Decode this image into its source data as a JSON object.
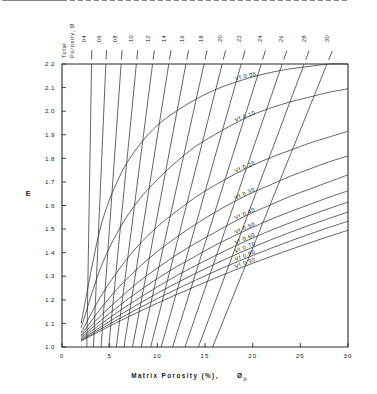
{
  "figure": {
    "title": "",
    "y_axis_label": "E",
    "x_axis_label": "Matrix Porosity  (%),",
    "x_axis_label_sub": "b",
    "x_axis_label_symbol": "Ø",
    "top_axis_label_line1": "Total",
    "top_axis_label_line2": "Porosity,",
    "top_axis_label_symbol": "Ø",
    "marker_label": "VILLEROY 2",
    "marker_value": 1.555
  },
  "chart_data": {
    "type": "line",
    "title": "",
    "xlabel": "Matrix Porosity (%), Øb",
    "ylabel": "E",
    "xlim": [
      0,
      30
    ],
    "ylim": [
      1.0,
      2.2
    ],
    "grid": false,
    "legend_position": "inline-right",
    "x_ticks": [
      "0",
      "5",
      "10",
      "15",
      "20",
      "25",
      "30"
    ],
    "x_tick_values": [
      0,
      5,
      10,
      15,
      20,
      25,
      30
    ],
    "y_ticks": [
      "1.0",
      "1.1",
      "1.2",
      "1.3",
      "1.4",
      "1.5",
      "1.6",
      "1.7",
      "1.8",
      "1.9",
      "2.0",
      "2.1",
      "2.2"
    ],
    "y_tick_values": [
      1.0,
      1.1,
      1.2,
      1.3,
      1.4,
      1.5,
      1.6,
      1.7,
      1.8,
      1.9,
      2.0,
      2.1,
      2.2
    ],
    "annotations": [
      {
        "text": "VILLEROY 2",
        "y": 1.555,
        "style": "dashed-horizontal"
      }
    ],
    "series": [
      {
        "name": "Vf 0.05",
        "label": "Vf  0.05",
        "vf": 0.05,
        "points": [
          [
            2.0,
            1.1
          ],
          [
            4.0,
            1.5
          ],
          [
            6.0,
            1.72
          ],
          [
            8.0,
            1.85
          ],
          [
            10.0,
            1.94
          ],
          [
            12.0,
            2.0
          ],
          [
            14.0,
            2.05
          ],
          [
            16.0,
            2.09
          ],
          [
            18.0,
            2.12
          ],
          [
            20.0,
            2.145
          ],
          [
            22.0,
            2.165
          ],
          [
            24.0,
            2.18
          ],
          [
            26.0,
            2.19
          ],
          [
            28.0,
            2.2
          ],
          [
            30.0,
            2.205
          ]
        ]
      },
      {
        "name": "Vf 0.10",
        "label": "Vf  0.10",
        "vf": 0.1,
        "points": [
          [
            2.0,
            1.08
          ],
          [
            4.0,
            1.33
          ],
          [
            6.0,
            1.5
          ],
          [
            8.0,
            1.62
          ],
          [
            10.0,
            1.71
          ],
          [
            12.0,
            1.785
          ],
          [
            14.0,
            1.85
          ],
          [
            16.0,
            1.9
          ],
          [
            18.0,
            1.945
          ],
          [
            20.0,
            1.985
          ],
          [
            22.0,
            2.015
          ],
          [
            24.0,
            2.04
          ],
          [
            26.0,
            2.06
          ],
          [
            28.0,
            2.08
          ],
          [
            30.0,
            2.095
          ]
        ]
      },
      {
        "name": "Vf 0.20",
        "label": "Vf 0.20",
        "vf": 0.2,
        "points": [
          [
            2.0,
            1.06
          ],
          [
            4.0,
            1.21
          ],
          [
            6.0,
            1.33
          ],
          [
            8.0,
            1.43
          ],
          [
            10.0,
            1.51
          ],
          [
            12.0,
            1.575
          ],
          [
            14.0,
            1.635
          ],
          [
            16.0,
            1.685
          ],
          [
            18.0,
            1.73
          ],
          [
            20.0,
            1.77
          ],
          [
            22.0,
            1.805
          ],
          [
            24.0,
            1.835
          ],
          [
            26.0,
            1.865
          ],
          [
            28.0,
            1.89
          ],
          [
            30.0,
            1.915
          ]
        ]
      },
      {
        "name": "Vf 0.30",
        "label": "Vf  0.30",
        "vf": 0.3,
        "points": [
          [
            2.0,
            1.05
          ],
          [
            4.0,
            1.16
          ],
          [
            6.0,
            1.255
          ],
          [
            8.0,
            1.335
          ],
          [
            10.0,
            1.405
          ],
          [
            12.0,
            1.465
          ],
          [
            14.0,
            1.52
          ],
          [
            16.0,
            1.57
          ],
          [
            18.0,
            1.615
          ],
          [
            20.0,
            1.655
          ],
          [
            22.0,
            1.69
          ],
          [
            24.0,
            1.725
          ],
          [
            26.0,
            1.755
          ],
          [
            28.0,
            1.785
          ],
          [
            30.0,
            1.81
          ]
        ]
      },
      {
        "name": "Vf 0.40",
        "label": "Vf  0.40",
        "vf": 0.4,
        "points": [
          [
            2.0,
            1.045
          ],
          [
            4.0,
            1.13
          ],
          [
            6.0,
            1.205
          ],
          [
            8.0,
            1.275
          ],
          [
            10.0,
            1.335
          ],
          [
            12.0,
            1.39
          ],
          [
            14.0,
            1.44
          ],
          [
            16.0,
            1.485
          ],
          [
            18.0,
            1.53
          ],
          [
            20.0,
            1.57
          ],
          [
            22.0,
            1.605
          ],
          [
            24.0,
            1.64
          ],
          [
            26.0,
            1.67
          ],
          [
            28.0,
            1.7
          ],
          [
            30.0,
            1.73
          ]
        ]
      },
      {
        "name": "Vf 0.50",
        "label": "Vf  0.50",
        "vf": 0.5,
        "points": [
          [
            2.0,
            1.04
          ],
          [
            4.0,
            1.11
          ],
          [
            6.0,
            1.175
          ],
          [
            8.0,
            1.235
          ],
          [
            10.0,
            1.29
          ],
          [
            12.0,
            1.34
          ],
          [
            14.0,
            1.385
          ],
          [
            16.0,
            1.43
          ],
          [
            18.0,
            1.47
          ],
          [
            20.0,
            1.508
          ],
          [
            22.0,
            1.543
          ],
          [
            24.0,
            1.575
          ],
          [
            26.0,
            1.605
          ],
          [
            28.0,
            1.635
          ],
          [
            30.0,
            1.662
          ]
        ]
      },
      {
        "name": "Vf 0.60",
        "label": "Vf  0.60",
        "vf": 0.6,
        "points": [
          [
            2.0,
            1.035
          ],
          [
            4.0,
            1.095
          ],
          [
            6.0,
            1.152
          ],
          [
            8.0,
            1.205
          ],
          [
            10.0,
            1.255
          ],
          [
            12.0,
            1.302
          ],
          [
            14.0,
            1.345
          ],
          [
            16.0,
            1.386
          ],
          [
            18.0,
            1.425
          ],
          [
            20.0,
            1.462
          ],
          [
            22.0,
            1.496
          ],
          [
            24.0,
            1.528
          ],
          [
            26.0,
            1.558
          ],
          [
            28.0,
            1.587
          ],
          [
            30.0,
            1.614
          ]
        ]
      },
      {
        "name": "Vf 0.70",
        "label": "Vf  0.70",
        "vf": 0.7,
        "points": [
          [
            2.0,
            1.03
          ],
          [
            4.0,
            1.083
          ],
          [
            6.0,
            1.134
          ],
          [
            8.0,
            1.182
          ],
          [
            10.0,
            1.228
          ],
          [
            12.0,
            1.271
          ],
          [
            14.0,
            1.312
          ],
          [
            16.0,
            1.351
          ],
          [
            18.0,
            1.388
          ],
          [
            20.0,
            1.423
          ],
          [
            22.0,
            1.456
          ],
          [
            24.0,
            1.487
          ],
          [
            26.0,
            1.517
          ],
          [
            28.0,
            1.545
          ],
          [
            30.0,
            1.572
          ]
        ]
      },
      {
        "name": "Vf 0.80",
        "label": "Vf  0.80",
        "vf": 0.8,
        "points": [
          [
            2.0,
            1.028
          ],
          [
            4.0,
            1.075
          ],
          [
            6.0,
            1.12
          ],
          [
            8.0,
            1.163
          ],
          [
            10.0,
            1.205
          ],
          [
            12.0,
            1.245
          ],
          [
            14.0,
            1.283
          ],
          [
            16.0,
            1.32
          ],
          [
            18.0,
            1.355
          ],
          [
            20.0,
            1.388
          ],
          [
            22.0,
            1.42
          ],
          [
            24.0,
            1.45
          ],
          [
            26.0,
            1.479
          ],
          [
            28.0,
            1.507
          ],
          [
            30.0,
            1.533
          ]
        ]
      },
      {
        "name": "Vf 0.90",
        "label": "Vf  0.90",
        "vf": 0.9,
        "points": [
          [
            2.0,
            1.025
          ],
          [
            4.0,
            1.068
          ],
          [
            6.0,
            1.109
          ],
          [
            8.0,
            1.148
          ],
          [
            10.0,
            1.186
          ],
          [
            12.0,
            1.222
          ],
          [
            14.0,
            1.257
          ],
          [
            16.0,
            1.291
          ],
          [
            18.0,
            1.324
          ],
          [
            20.0,
            1.355
          ],
          [
            22.0,
            1.385
          ],
          [
            24.0,
            1.414
          ],
          [
            26.0,
            1.442
          ],
          [
            28.0,
            1.469
          ],
          [
            30.0,
            1.495
          ]
        ]
      }
    ],
    "total_porosity_lines": [
      {
        "label": ".04",
        "value": 0.04,
        "x_bottom": 2.6,
        "x_top": 3.1
      },
      {
        "label": ".06",
        "value": 0.06,
        "x_bottom": 3.3,
        "x_top": 4.6
      },
      {
        "label": ".08",
        "value": 0.08,
        "x_bottom": 4.1,
        "x_top": 6.2
      },
      {
        "label": ".10",
        "value": 0.1,
        "x_bottom": 4.9,
        "x_top": 7.8
      },
      {
        "label": ".12",
        "value": 0.12,
        "x_bottom": 5.7,
        "x_top": 9.5
      },
      {
        "label": ".14",
        "value": 0.14,
        "x_bottom": 6.5,
        "x_top": 11.2
      },
      {
        "label": ".16",
        "value": 0.16,
        "x_bottom": 7.4,
        "x_top": 13.0
      },
      {
        "label": ".18",
        "value": 0.18,
        "x_bottom": 8.3,
        "x_top": 14.9
      },
      {
        "label": ".20",
        "value": 0.2,
        "x_bottom": 9.3,
        "x_top": 16.8
      },
      {
        "label": ".22",
        "value": 0.22,
        "x_bottom": 10.4,
        "x_top": 18.8
      },
      {
        "label": ".24",
        "value": 0.24,
        "x_bottom": 11.6,
        "x_top": 20.9
      },
      {
        "label": ".26",
        "value": 0.26,
        "x_bottom": 12.9,
        "x_top": 23.1
      },
      {
        "label": ".28",
        "value": 0.28,
        "x_bottom": 14.3,
        "x_top": 25.4
      },
      {
        "label": ".30",
        "value": 0.3,
        "x_bottom": 15.8,
        "x_top": 27.8
      }
    ]
  }
}
